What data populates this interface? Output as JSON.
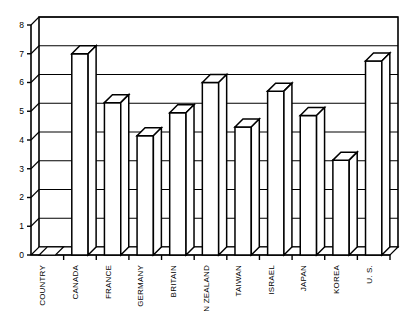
{
  "chart_data": {
    "type": "bar",
    "title": "",
    "subtitle": "",
    "xlabel": "",
    "ylabel": "",
    "ylim": [
      0,
      8
    ],
    "ytick_labels": [
      "0",
      "1",
      "2",
      "3",
      "4",
      "5",
      "6",
      "7",
      "8"
    ],
    "ytick_values": [
      0,
      1,
      2,
      3,
      4,
      5,
      6,
      7,
      8
    ],
    "grid": true,
    "grid_axis": "y",
    "legend": false,
    "legend_position": "none",
    "style": "3d-bar",
    "categories": [
      "COUNTRY",
      "CANADA",
      "FRANCE",
      "GERMANY",
      "BRITAIN",
      "N ZEALAND",
      "TAIWAN",
      "ISRAEL",
      "JAPAN",
      "KOREA",
      "U. S."
    ],
    "values": [
      0,
      7.0,
      5.3,
      4.15,
      4.95,
      6.0,
      4.45,
      5.7,
      4.85,
      3.3,
      6.75
    ],
    "colors": {
      "bar_fill": "#ffffff",
      "bar_stroke": "#000000",
      "grid": "#000000",
      "axis": "#000000",
      "background": "#ffffff"
    }
  }
}
